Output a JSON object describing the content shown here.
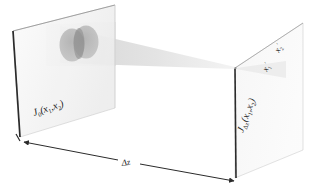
{
  "figure": {
    "background_color": "#ffffff",
    "width": 309,
    "height": 189
  },
  "labels": {
    "source_plane": {
      "symbol": "J",
      "subscript": "0",
      "args_open": "(",
      "arg1": "x",
      "arg1_sub": "1",
      "comma": ",",
      "arg2": "x",
      "arg2_sub": "2",
      "args_close": ")",
      "full_text": "J0(x1,x2)"
    },
    "observation_plane": {
      "symbol": "J",
      "subscript": "Δz",
      "args_open": "(",
      "arg1": "x",
      "arg1_sub": "1",
      "comma": ",",
      "arg2": "x",
      "arg2_sub": "2",
      "args_close": ")",
      "full_text": "JΔz(x1,x2)"
    },
    "distance": {
      "text": "Δz"
    },
    "axis_x1_prime": {
      "symbol": "x",
      "subscript": "1",
      "prime": "′",
      "full_text": "x1′"
    },
    "axis_x2_prime": {
      "symbol": "x",
      "subscript": "2",
      "prime": "′",
      "full_text": "x2′"
    }
  },
  "colors": {
    "edge_dark": "#2b2b2b",
    "plane_fill": "#f2f2f2",
    "plane_stroke": "#c8c8c8",
    "beam_fill": "#d8d8d8",
    "beam_fill_light": "#e6e6e6",
    "aperture_fill": "#a8a8a8",
    "aperture_overlap": "#8d8d8d",
    "arrow_color": "#2b2b2b",
    "text_color": "#1a1a1a"
  },
  "geometry": {
    "left_plane_label": "source-plane",
    "right_plane_label": "observation-plane",
    "beam_label": "converging-beam-cone",
    "vertex_label": "beam-focus-point",
    "aperture_count": 2
  }
}
